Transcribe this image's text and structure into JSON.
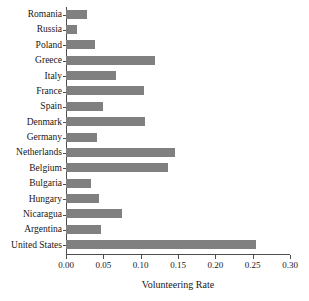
{
  "chart_data": {
    "type": "bar",
    "orientation": "horizontal",
    "title": "",
    "xlabel": "Volunteering Rate",
    "ylabel": "",
    "xlim": [
      0.0,
      0.3
    ],
    "xticks": [
      "0.00",
      "0.05",
      "0.10",
      "0.15",
      "0.20",
      "0.25",
      "0.30"
    ],
    "xtick_values": [
      0.0,
      0.05,
      0.1,
      0.15,
      0.2,
      0.25,
      0.3
    ],
    "grid": false,
    "legend": null,
    "bar_color": "#808080",
    "axis_color": "#4d4d4d",
    "categories": [
      "Romania",
      "Russia",
      "Poland",
      "Greece",
      "Italy",
      "France",
      "Spain",
      "Denmark",
      "Germany",
      "Netherlands",
      "Belgium",
      "Bulgaria",
      "Hungary",
      "Nicaragua",
      "Argentina",
      "United States"
    ],
    "values": [
      0.028,
      0.015,
      0.039,
      0.119,
      0.067,
      0.104,
      0.05,
      0.106,
      0.041,
      0.146,
      0.137,
      0.033,
      0.044,
      0.075,
      0.047,
      0.255
    ]
  }
}
